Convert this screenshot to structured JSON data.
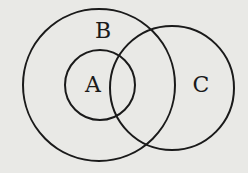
{
  "diagram": {
    "type": "venn",
    "sets": [
      {
        "label": "B",
        "relation": "contains A, partially overlaps C"
      },
      {
        "label": "A",
        "relation": "subset of B, partially overlaps C"
      },
      {
        "label": "C",
        "relation": "partially overlaps A and B"
      }
    ],
    "labels": {
      "a": "A",
      "b": "B",
      "c": "C"
    },
    "stroke_color": "#1a1a1a",
    "background_color": "#e9e9e6"
  }
}
